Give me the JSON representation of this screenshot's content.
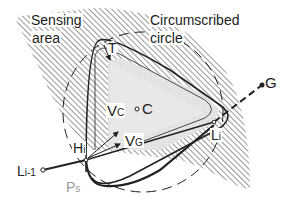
{
  "diagram": {
    "labels": {
      "sensing_area_1": "Sensing",
      "sensing_area_2": "area",
      "circumscribed_1": "Circumscribed",
      "circumscribed_2": "circle",
      "T": "T",
      "Vc_main": "V",
      "Vc_sub": "C",
      "C": "C",
      "Vg_main": "V",
      "Vg_sub": "G",
      "Hi_main": "H",
      "Hi_sub": "i",
      "Li_main": "L",
      "Li_sub": "i",
      "Li1_main": "L",
      "Li1_sub": "i-1",
      "Ps_main": "P",
      "Ps_sub": "s",
      "G": "G"
    },
    "colors": {
      "line": "#222222",
      "hatch": "#444444",
      "inner_fill": "#e4e4e4",
      "ps_label": "#9a9a9a",
      "background": "#ffffff"
    }
  }
}
